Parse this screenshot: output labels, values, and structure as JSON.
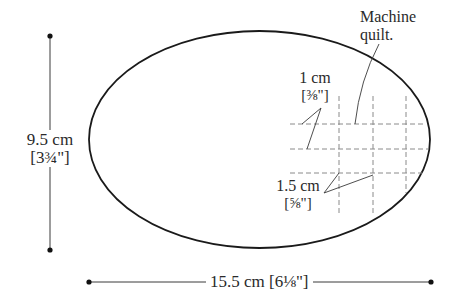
{
  "diagram": {
    "shape": "oval",
    "stroke_color": "#1a1a1a",
    "dash_color": "#8a8a8a",
    "labels": {
      "height_cm": "9.5 cm",
      "height_in": "[3¾\"]",
      "width": "15.5 cm [6⅛\"]",
      "machine_quilt_line1": "Machine",
      "machine_quilt_line2": "quilt.",
      "spacing_small_cm": "1 cm",
      "spacing_small_in": "[⅜\"]",
      "spacing_large_cm": "1.5 cm",
      "spacing_large_in": "[⅝\"]"
    },
    "grid": {
      "horizontal_lines_y": [
        124,
        149,
        173
      ],
      "vertical_lines_x": [
        339,
        373,
        406
      ]
    }
  }
}
